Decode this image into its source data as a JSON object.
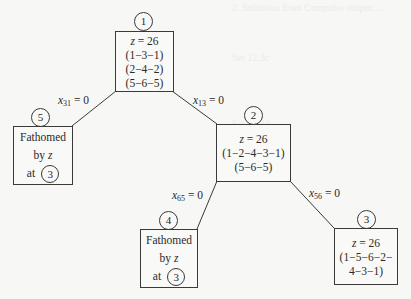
{
  "background_text": [
    "2. Solutions from Computer output: ...",
    "Set 12.3c",
    "Set 12.3d"
  ],
  "nodes": [
    {
      "id": "1",
      "num": "1",
      "z": "z = 26",
      "lines": [
        "(1−3−1)",
        "(2−4−2)",
        "(5−6−5)"
      ]
    },
    {
      "id": "2",
      "num": "2",
      "z": "z = 26",
      "lines": [
        "(1−2−4−3−1)",
        "(5−6−5)"
      ]
    },
    {
      "id": "3",
      "num": "3",
      "z": "z = 26",
      "lines": [
        "(1−5−6−2−",
        "4−3−1)"
      ]
    },
    {
      "id": "4",
      "num": "4",
      "fathomed": [
        "Fathomed",
        "by z",
        "at"
      ],
      "ref": "3"
    },
    {
      "id": "5",
      "num": "5",
      "fathomed": [
        "Fathomed",
        "by z",
        "at"
      ],
      "ref": "3"
    }
  ],
  "edges": [
    {
      "from": "1",
      "to": "5",
      "var": "x",
      "sub": "31",
      "eq": " = 0"
    },
    {
      "from": "1",
      "to": "2",
      "var": "x",
      "sub": "13",
      "eq": " = 0"
    },
    {
      "from": "2",
      "to": "4",
      "var": "x",
      "sub": "65",
      "eq": " = 0"
    },
    {
      "from": "2",
      "to": "3",
      "var": "x",
      "sub": "56",
      "eq": " = 0"
    }
  ],
  "colors": {
    "line": "#3a3a3a",
    "background": "#f7f7f5"
  }
}
